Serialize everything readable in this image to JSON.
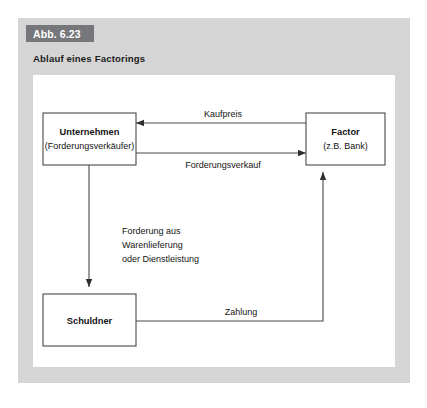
{
  "figure": {
    "badge": "Abb. 6.23",
    "title": "Ablauf eines Factorings",
    "badge_color": "#76777a",
    "panel_color": "#d5d5d5",
    "canvas_color": "#ffffff",
    "line_color": "#4a4a4a"
  },
  "diagram": {
    "type": "flowchart",
    "nodes": [
      {
        "id": "unternehmen",
        "title": "Unternehmen",
        "subtitle": "(Forderungsverkäufer)"
      },
      {
        "id": "factor",
        "title": "Factor",
        "subtitle": "(z.B. Bank)"
      },
      {
        "id": "schuldner",
        "title": "Schuldner",
        "subtitle": ""
      }
    ],
    "edges": [
      {
        "id": "kaufpreis",
        "label": "Kaufpreis",
        "from": "factor",
        "to": "unternehmen",
        "direction": "left"
      },
      {
        "id": "forderungsverkauf",
        "label": "Forderungsverkauf",
        "from": "unternehmen",
        "to": "factor",
        "direction": "right"
      },
      {
        "id": "forderung",
        "label_lines": [
          "Forderung aus",
          "Warenlieferung",
          "oder Dienstleistung"
        ],
        "line1": "Forderung aus",
        "line2": "Warenlieferung",
        "line3": "oder Dienstleistung",
        "from": "unternehmen",
        "to": "schuldner",
        "direction": "down"
      },
      {
        "id": "zahlung",
        "label": "Zahlung",
        "from": "schuldner",
        "to": "factor",
        "direction": "up"
      }
    ]
  }
}
